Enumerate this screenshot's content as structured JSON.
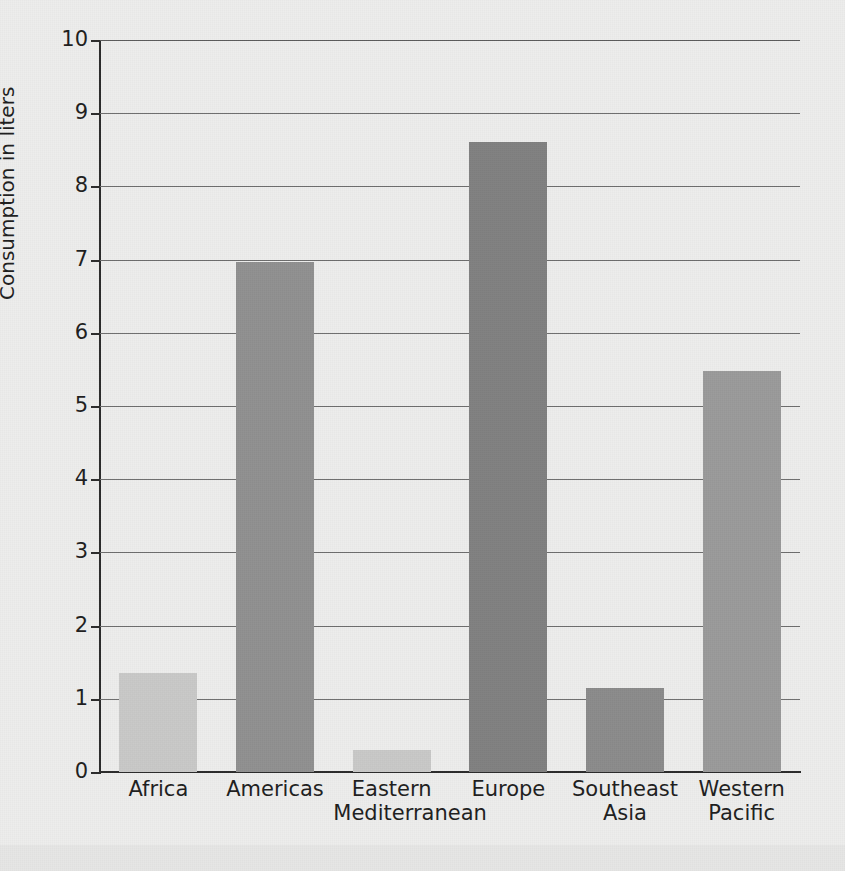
{
  "chart_data": {
    "type": "bar",
    "title": "",
    "subtitle": "",
    "xlabel": "",
    "ylabel": "Consumption in liters",
    "ylim": [
      0,
      10
    ],
    "ytick_labels": [
      "10",
      "9",
      "8",
      "7",
      "6",
      "5",
      "4",
      "3",
      "2",
      "1",
      "0"
    ],
    "ytick_values": [
      10,
      9,
      8,
      7,
      6,
      5,
      4,
      3,
      2,
      1,
      0
    ],
    "grid": "horizontal",
    "legend": "none",
    "categories": [
      "Africa",
      "Eastern\nMediterranean",
      "Americas",
      "Europe",
      "Southeast\nAsia",
      "Western\nPacific"
    ],
    "bars": [
      {
        "category": "Africa",
        "label_line1": "Africa",
        "label_line2": "",
        "value": 1.35,
        "color": "#c8c8c7"
      },
      {
        "category": "Americas",
        "label_line1": "Americas",
        "label_line2": "",
        "value": 6.97,
        "color": "#909090"
      },
      {
        "category": "Eastern Mediterranean",
        "label_line1": "Eastern",
        "label_line2": "Mediterranean",
        "value": 0.3,
        "color": "#c8c8c7"
      },
      {
        "category": "Europe",
        "label_line1": "Europe",
        "label_line2": "",
        "value": 8.6,
        "color": "#808080"
      },
      {
        "category": "Southeast Asia",
        "label_line1": "Southeast",
        "label_line2": "Asia",
        "value": 1.15,
        "color": "#8b8b8b"
      },
      {
        "category": "Western Pacific",
        "label_line1": "Western",
        "label_line2": "Pacific",
        "value": 5.48,
        "color": "#9a9a9a"
      }
    ],
    "values": [
      1.35,
      6.97,
      0.3,
      8.6,
      1.15,
      5.48
    ],
    "colors": {
      "background": "#ededec",
      "axis": "#2b2b2b",
      "gridline": "#6d6d6d",
      "text": "#1d1d1d"
    }
  }
}
